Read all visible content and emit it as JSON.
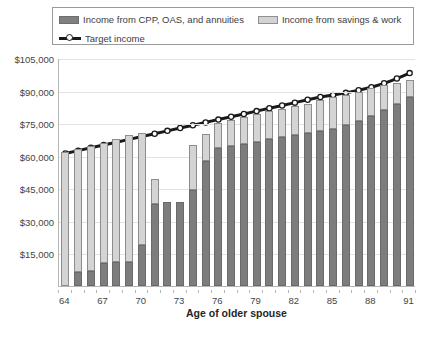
{
  "legend": {
    "items": [
      {
        "label": "Income from CPP, OAS, and annuities",
        "swatch": "dark-gray-swatch",
        "color": "#808080"
      },
      {
        "label": "Income from savings & work",
        "swatch": "light-gray-swatch",
        "color": "#d3d3d3"
      },
      {
        "label": "Target income",
        "swatch": "target-line-marker",
        "color": "#1a1a1a"
      }
    ]
  },
  "axes": {
    "y_ticks": [
      "$105,000",
      "$90,000",
      "$75,000",
      "$60,000",
      "$45,000",
      "$30,000",
      "$15,000"
    ],
    "x_title": "Age of older spouse",
    "x_ticks": [
      "64",
      "67",
      "70",
      "73",
      "76",
      "79",
      "82",
      "85",
      "88",
      "91"
    ]
  },
  "chart_data": {
    "type": "bar",
    "title": "",
    "subtitle": "",
    "xlabel": "Age of older spouse",
    "ylabel": "",
    "ylim": [
      0,
      105000
    ],
    "ytick_step": 15000,
    "grid": true,
    "legend_position": "top",
    "stacked": true,
    "categories": [
      64,
      65,
      66,
      67,
      68,
      69,
      70,
      71,
      72,
      73,
      74,
      75,
      76,
      77,
      78,
      79,
      80,
      81,
      82,
      83,
      84,
      85,
      86,
      87,
      88,
      89,
      90,
      91
    ],
    "series": [
      {
        "name": "Income from CPP, OAS, and annuities",
        "color": "#7d7d7d",
        "values": [
          0,
          6500,
          6800,
          10500,
          11000,
          11200,
          19000,
          38000,
          38500,
          38800,
          44000,
          57500,
          63500,
          64500,
          65500,
          66500,
          67500,
          68500,
          69500,
          70500,
          71500,
          72500,
          74000,
          76000,
          78500,
          81000,
          84000,
          87000
        ]
      },
      {
        "name": "Income from savings & work",
        "color": "#d4d4d4",
        "values": [
          61500,
          56500,
          57500,
          55500,
          56500,
          58500,
          51500,
          11500,
          0,
          0,
          21000,
          12500,
          11500,
          12000,
          12500,
          12500,
          13000,
          13000,
          13500,
          13500,
          14000,
          14500,
          14000,
          13500,
          12500,
          11500,
          9500,
          8000
        ]
      }
    ],
    "target_line": {
      "name": "Target income",
      "color": "#1a1a1a",
      "marker": "circle-open",
      "values": [
        61500,
        62800,
        64100,
        65400,
        66700,
        68000,
        69300,
        70600,
        71900,
        73200,
        74500,
        75800,
        77100,
        78400,
        79700,
        81000,
        82300,
        83600,
        84900,
        86200,
        87500,
        88400,
        89400,
        90600,
        92000,
        93800,
        96000,
        98500
      ]
    }
  }
}
